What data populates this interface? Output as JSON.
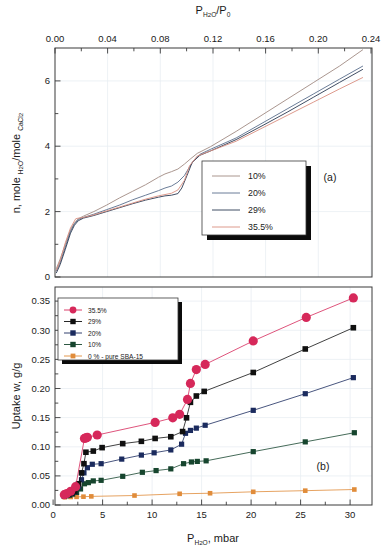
{
  "figure": {
    "panel_a_label": "(a)",
    "panel_b_label": "(b)"
  },
  "chart_data": [
    {
      "type": "line",
      "panel": "(a)",
      "title": "",
      "xlabel": "P_H2O/P_0",
      "xlabel_parts": {
        "p": "P",
        "sub": "H",
        "sub2": "2",
        "sub3": "O",
        "div": "/P",
        "sub4": "0"
      },
      "ylabel": "n, mole_H2O/mole_CaCl2",
      "ylabel_parts": {
        "lead": "n, mole ",
        "sub1": "H",
        "sub1b": "2",
        "sub1c": "O",
        "mid": "/mole ",
        "sub2": "CaCl",
        "sub2b": "2"
      },
      "xlim": [
        0.0,
        0.245
      ],
      "ylim": [
        0.0,
        7.0
      ],
      "xticks": [
        0.0,
        0.04,
        0.08,
        0.12,
        0.16,
        0.2,
        0.24
      ],
      "xticklabels": [
        "0.00",
        "0.04",
        "0.08",
        "0.12",
        "0.16",
        "0.20",
        "0.24"
      ],
      "xminorticks": [
        0.02,
        0.06,
        0.1,
        0.14,
        0.18,
        0.22
      ],
      "yticks": [
        0,
        2,
        4,
        6
      ],
      "yticklabels": [
        "0",
        "2",
        "4",
        "6"
      ],
      "yminorticks": [
        1,
        3,
        5
      ],
      "grid": true,
      "axis_position": {
        "x": "top",
        "y": "left"
      },
      "legend_position": "center-right",
      "series": [
        {
          "name": "10%",
          "color": "#a08a82",
          "x": [
            0.001,
            0.004,
            0.008,
            0.012,
            0.015,
            0.018,
            0.022,
            0.03,
            0.04,
            0.05,
            0.06,
            0.07,
            0.08,
            0.085,
            0.09,
            0.095,
            0.1,
            0.105,
            0.11,
            0.12,
            0.14,
            0.16,
            0.18,
            0.2,
            0.22,
            0.238
          ],
          "y": [
            0.25,
            0.55,
            1.0,
            1.45,
            1.65,
            1.78,
            1.86,
            2.0,
            2.2,
            2.42,
            2.62,
            2.82,
            3.05,
            3.15,
            3.22,
            3.3,
            3.45,
            3.62,
            3.78,
            3.98,
            4.45,
            4.95,
            5.45,
            5.95,
            6.45,
            6.95
          ]
        },
        {
          "name": "20%",
          "color": "#5a6e8c",
          "x": [
            0.001,
            0.004,
            0.008,
            0.012,
            0.015,
            0.018,
            0.022,
            0.03,
            0.04,
            0.05,
            0.06,
            0.07,
            0.08,
            0.085,
            0.09,
            0.095,
            0.1,
            0.103,
            0.107,
            0.112,
            0.12,
            0.14,
            0.16,
            0.18,
            0.2,
            0.22,
            0.238
          ],
          "y": [
            0.18,
            0.45,
            0.92,
            1.4,
            1.62,
            1.76,
            1.82,
            1.92,
            2.06,
            2.2,
            2.36,
            2.5,
            2.64,
            2.72,
            2.78,
            2.9,
            3.1,
            3.3,
            3.55,
            3.75,
            3.9,
            4.25,
            4.7,
            5.15,
            5.6,
            6.05,
            6.45
          ]
        },
        {
          "name": "29%",
          "color": "#2b3a52",
          "x": [
            0.001,
            0.004,
            0.008,
            0.012,
            0.015,
            0.018,
            0.022,
            0.03,
            0.04,
            0.05,
            0.06,
            0.07,
            0.08,
            0.085,
            0.09,
            0.095,
            0.098,
            0.102,
            0.106,
            0.112,
            0.12,
            0.14,
            0.16,
            0.18,
            0.2,
            0.22,
            0.238
          ],
          "y": [
            0.12,
            0.38,
            0.85,
            1.34,
            1.58,
            1.72,
            1.8,
            1.88,
            2.0,
            2.12,
            2.24,
            2.35,
            2.44,
            2.48,
            2.5,
            2.55,
            2.72,
            3.1,
            3.5,
            3.72,
            3.85,
            4.2,
            4.62,
            5.05,
            5.5,
            5.95,
            6.35
          ]
        },
        {
          "name": "35.5%",
          "color": "#d98f80",
          "x": [
            0.001,
            0.004,
            0.008,
            0.012,
            0.016,
            0.018,
            0.0185,
            0.022,
            0.03,
            0.04,
            0.05,
            0.06,
            0.07,
            0.08,
            0.085,
            0.09,
            0.095,
            0.1,
            0.104,
            0.11,
            0.12,
            0.14,
            0.16,
            0.18,
            0.2,
            0.22,
            0.238
          ],
          "y": [
            0.2,
            0.5,
            1.05,
            1.5,
            1.78,
            1.8,
            1.8,
            1.82,
            1.9,
            2.02,
            2.14,
            2.26,
            2.38,
            2.48,
            2.52,
            2.56,
            2.66,
            2.95,
            3.4,
            3.7,
            3.85,
            4.15,
            4.55,
            4.95,
            5.35,
            5.75,
            6.1
          ]
        }
      ],
      "legend": [
        "10%",
        "20%",
        "29%",
        "35.5%"
      ]
    },
    {
      "type": "scatter",
      "panel": "(b)",
      "title": "",
      "xlabel": "P_H2O, mbar",
      "xlabel_parts": {
        "p": "P",
        "sub": "H",
        "sub2": "2",
        "sub3": "O",
        "tail": ", mbar"
      },
      "ylabel": "Uptake w, g/g",
      "xlim": [
        -0.8,
        31.5
      ],
      "ylim": [
        -0.012,
        0.368
      ],
      "xticks": [
        0,
        5,
        10,
        15,
        20,
        25,
        30
      ],
      "xticklabels": [
        "0",
        "5",
        "10",
        "15",
        "20",
        "25",
        "30"
      ],
      "yticks": [
        0.0,
        0.05,
        0.1,
        0.15,
        0.2,
        0.25,
        0.3,
        0.35
      ],
      "yticklabels": [
        "0.00",
        "0.05",
        "0.10",
        "0.15",
        "0.20",
        "0.25",
        "0.30",
        "0.35"
      ],
      "grid": true,
      "legend_position": "upper-left",
      "series": [
        {
          "name": "35.5%",
          "color": "#d6285a",
          "marker": "circle",
          "markersize": 4.6,
          "x": [
            0.15,
            0.4,
            0.8,
            1.3,
            2.2,
            2.35,
            2.5,
            3.5,
            9.4,
            11.2,
            11.9,
            12.7,
            13.0,
            13.6,
            14.5,
            19.4,
            24.8,
            29.6
          ],
          "y": [
            0.006,
            0.008,
            0.012,
            0.02,
            0.104,
            0.105,
            0.106,
            0.11,
            0.132,
            0.14,
            0.146,
            0.172,
            0.2,
            0.224,
            0.233,
            0.274,
            0.315,
            0.349
          ]
        },
        {
          "name": "29%",
          "color": "#101010",
          "marker": "square",
          "markersize": 2.8,
          "x": [
            0.15,
            0.35,
            0.6,
            0.9,
            1.2,
            1.6,
            1.9,
            2.15,
            2.35,
            3.1,
            4.0,
            6.1,
            8.0,
            9.4,
            11.0,
            12.2,
            12.6,
            13.0,
            13.6,
            14.4,
            19.4,
            24.7,
            29.6
          ],
          "y": [
            0.005,
            0.006,
            0.007,
            0.009,
            0.012,
            0.025,
            0.044,
            0.06,
            0.08,
            0.082,
            0.088,
            0.095,
            0.099,
            0.104,
            0.107,
            0.116,
            0.14,
            0.167,
            0.178,
            0.186,
            0.219,
            0.26,
            0.297
          ]
        },
        {
          "name": "20%",
          "color": "#1b2b5e",
          "marker": "square",
          "markersize": 2.6,
          "x": [
            0.15,
            0.35,
            0.6,
            0.9,
            1.2,
            1.6,
            1.9,
            2.15,
            2.5,
            3.0,
            3.9,
            6.0,
            8.0,
            9.3,
            11.0,
            12.1,
            12.5,
            13.0,
            13.6,
            14.5,
            19.4,
            24.7,
            29.6
          ],
          "y": [
            0.004,
            0.005,
            0.006,
            0.008,
            0.011,
            0.02,
            0.032,
            0.044,
            0.053,
            0.059,
            0.06,
            0.068,
            0.075,
            0.079,
            0.084,
            0.094,
            0.113,
            0.118,
            0.122,
            0.127,
            0.153,
            0.182,
            0.21
          ]
        },
        {
          "name": "10%",
          "color": "#16452e",
          "marker": "square",
          "markersize": 2.6,
          "x": [
            0.15,
            0.4,
            0.7,
            1.0,
            1.4,
            1.8,
            2.2,
            2.6,
            3.1,
            3.9,
            6.1,
            8.1,
            9.5,
            11.0,
            12.3,
            13.1,
            13.7,
            14.6,
            19.4,
            24.7,
            29.7
          ],
          "y": [
            0.003,
            0.004,
            0.005,
            0.007,
            0.01,
            0.016,
            0.025,
            0.027,
            0.03,
            0.031,
            0.038,
            0.045,
            0.048,
            0.051,
            0.06,
            0.063,
            0.064,
            0.065,
            0.081,
            0.098,
            0.114
          ]
        },
        {
          "name": "0 % - pure SBA-15",
          "color": "#e08c3a",
          "marker": "square",
          "markersize": 2.3,
          "x": [
            0.2,
            0.8,
            1.4,
            2.1,
            2.9,
            7.3,
            11.9,
            15.0,
            19.4,
            24.7,
            29.7
          ],
          "y": [
            0.0015,
            0.002,
            0.0022,
            0.0025,
            0.003,
            0.0045,
            0.0075,
            0.0085,
            0.011,
            0.013,
            0.015
          ]
        }
      ],
      "legend": [
        "35.5%",
        "29%",
        "20%",
        "10%",
        "0 % - pure SBA-15"
      ]
    }
  ]
}
